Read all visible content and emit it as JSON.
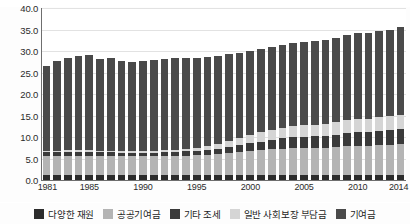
{
  "axis": {
    "y_ticks": [
      "40.0",
      "35.0",
      "30.0",
      "25.0",
      "20.0",
      "15.0",
      "10.0",
      "5.0",
      "0.0"
    ],
    "x_ticks": [
      "1981",
      "1985",
      "1990",
      "1995",
      "2000",
      "2005",
      "2010",
      "2014"
    ]
  },
  "legend": {
    "items": [
      {
        "label": "다양한 재원",
        "color": "#2c2c2c",
        "icon": "legend-swatch"
      },
      {
        "label": "공공기여금",
        "color": "#b4b4b4",
        "icon": "legend-swatch"
      },
      {
        "label": "기타 조세",
        "color": "#3a3a3a",
        "icon": "legend-swatch"
      },
      {
        "label": "일반 사회보장 부담금",
        "color": "#d5d5d5",
        "icon": "legend-swatch"
      },
      {
        "label": "기여금",
        "color": "#4a4a4a",
        "icon": "legend-swatch"
      }
    ]
  },
  "top_ghost_text": "",
  "chart_data": {
    "type": "bar",
    "title": "",
    "subtitle": "",
    "xlabel": "",
    "ylabel": "",
    "ylim": [
      0,
      40
    ],
    "y_tick_step": 5,
    "grid": true,
    "stacked": true,
    "legend_position": "bottom",
    "categories": [
      "1981",
      "1982",
      "1983",
      "1984",
      "1985",
      "1986",
      "1987",
      "1988",
      "1989",
      "1990",
      "1991",
      "1992",
      "1993",
      "1994",
      "1995",
      "1996",
      "1997",
      "1998",
      "1999",
      "2000",
      "2001",
      "2002",
      "2003",
      "2004",
      "2005",
      "2006",
      "2007",
      "2008",
      "2009",
      "2010",
      "2011",
      "2012",
      "2013",
      "2014"
    ],
    "series": [
      {
        "name": "다양한 재원",
        "color": "#2c2c2c",
        "values": [
          1.1,
          1.1,
          1.1,
          1.1,
          1.1,
          1.1,
          1.1,
          1.1,
          1.1,
          1.1,
          1.1,
          1.1,
          1.1,
          1.1,
          1.1,
          1.1,
          1.1,
          1.1,
          1.1,
          1.1,
          1.1,
          1.1,
          1.1,
          1.1,
          1.1,
          1.1,
          1.1,
          1.1,
          1.1,
          1.1,
          1.1,
          1.1,
          1.1,
          1.1
        ]
      },
      {
        "name": "공공기여금",
        "color": "#b4b4b4",
        "values": [
          4.5,
          4.5,
          4.6,
          4.6,
          4.6,
          4.5,
          4.5,
          4.4,
          4.4,
          4.4,
          4.4,
          4.5,
          4.6,
          4.6,
          4.7,
          4.8,
          5.0,
          5.2,
          5.4,
          5.6,
          5.8,
          6.0,
          6.2,
          6.3,
          6.4,
          6.4,
          6.4,
          6.5,
          6.8,
          6.9,
          6.9,
          7.0,
          7.1,
          7.2
        ]
      },
      {
        "name": "기타 조세",
        "color": "#3a3a3a",
        "values": [
          0.9,
          0.9,
          0.9,
          0.9,
          0.9,
          0.9,
          0.9,
          0.9,
          0.9,
          0.9,
          0.9,
          0.9,
          0.9,
          1.0,
          1.0,
          1.1,
          1.2,
          1.4,
          1.6,
          1.8,
          2.0,
          2.2,
          2.4,
          2.5,
          2.6,
          2.7,
          2.8,
          2.9,
          3.0,
          3.1,
          3.2,
          3.3,
          3.4,
          3.5
        ]
      },
      {
        "name": "일반 사회보장 부담금",
        "color": "#d5d5d5",
        "values": [
          0.3,
          0.3,
          0.3,
          0.3,
          0.3,
          0.3,
          0.3,
          0.3,
          0.3,
          0.3,
          0.4,
          0.4,
          0.5,
          0.6,
          0.7,
          0.9,
          1.1,
          1.4,
          1.7,
          2.0,
          2.2,
          2.4,
          2.5,
          2.6,
          2.7,
          2.7,
          2.8,
          2.9,
          3.0,
          3.0,
          3.1,
          3.2,
          3.2,
          3.3
        ]
      },
      {
        "name": "기여금",
        "color": "#4a4a4a",
        "values": [
          19.7,
          20.8,
          21.4,
          22.0,
          22.1,
          21.4,
          21.6,
          21.0,
          20.8,
          20.9,
          21.2,
          21.3,
          21.4,
          21.1,
          20.9,
          20.7,
          20.4,
          20.1,
          19.8,
          19.5,
          19.3,
          19.2,
          19.3,
          19.3,
          19.3,
          19.4,
          19.4,
          19.6,
          19.9,
          20.0,
          19.9,
          20.1,
          20.2,
          20.4
        ]
      }
    ],
    "totals": [
      26.5,
      27.6,
      28.3,
      28.9,
      29.0,
      28.2,
      28.4,
      27.7,
      27.5,
      27.6,
      28.0,
      28.2,
      28.5,
      28.4,
      28.4,
      28.6,
      28.8,
      29.2,
      29.6,
      30.0,
      30.4,
      30.9,
      31.5,
      31.8,
      32.1,
      32.3,
      32.5,
      33.0,
      33.8,
      34.1,
      34.2,
      34.7,
      35.0,
      35.5
    ]
  }
}
